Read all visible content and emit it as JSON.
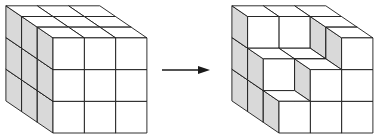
{
  "diagram": {
    "colors": {
      "stroke": "#1a1a1a",
      "top": "#ffffff",
      "front": "#ffffff",
      "side": "#d9d9d9",
      "background": "#ffffff"
    },
    "grid": {
      "cell_w": 31.3,
      "cell_h": 31.7,
      "depth_dx": -15.7,
      "depth_dy": -10.7
    },
    "left_cube": {
      "origin": [
        53,
        133
      ],
      "size": 3,
      "heights": [
        [
          3,
          3,
          3
        ],
        [
          3,
          3,
          3
        ],
        [
          3,
          3,
          3
        ]
      ]
    },
    "arrow": {
      "x1": 162,
      "y1": 70,
      "x2": 210,
      "y2": 70,
      "label": ""
    },
    "right_cube": {
      "origin": [
        279,
        133
      ],
      "size": 3,
      "heights": [
        [
          1,
          2,
          3
        ],
        [
          2,
          2,
          3
        ],
        [
          3,
          3,
          3
        ]
      ]
    }
  }
}
